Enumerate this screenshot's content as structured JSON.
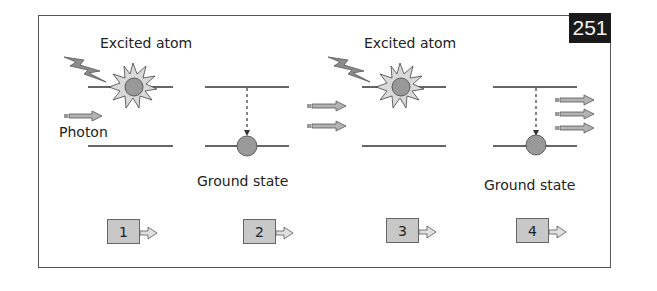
{
  "figure": {
    "page_number": "251",
    "labels": {
      "excited_atom_1": "Excited atom",
      "excited_atom_2": "Excited atom",
      "photon": "Photon",
      "ground_state_1": "Ground state",
      "ground_state_2": "Ground state"
    },
    "steps": [
      {
        "number": "1"
      },
      {
        "number": "2"
      },
      {
        "number": "3"
      },
      {
        "number": "4"
      }
    ],
    "colors": {
      "atom": "#999999",
      "starburst": "#d9d9d9",
      "arrow_fill": "#b3b3b3",
      "badge_bg": "#1a1a1a",
      "border": "#555555"
    }
  }
}
